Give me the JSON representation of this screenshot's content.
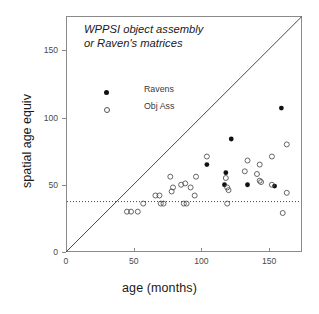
{
  "chart_data": {
    "type": "scatter",
    "title": "",
    "annotation_lines": [
      "WPPSI object assembly",
      "or Raven's matrices"
    ],
    "xlabel": "age (months)",
    "ylabel": "spatial age equiv",
    "xlim": [
      0,
      174
    ],
    "ylim": [
      0,
      175
    ],
    "xticks": [
      0,
      50,
      100,
      150
    ],
    "yticks": [
      0,
      50,
      100,
      150
    ],
    "xtick_labels": [
      "0",
      "50",
      "100",
      "150"
    ],
    "ytick_labels": [
      "0",
      "50",
      "100",
      "150"
    ],
    "grid": false,
    "legend_position": "upper-left-inside",
    "reference_lines": [
      {
        "name": "identity-line",
        "type": "diagonal",
        "from": [
          0,
          0
        ],
        "to": [
          174,
          175
        ],
        "style": "solid"
      },
      {
        "name": "floor-line",
        "type": "horizontal",
        "y": 37.5,
        "style": "dotted"
      }
    ],
    "series": [
      {
        "name": "Ravens",
        "marker": "filled-circle",
        "color": "#111111",
        "points": [
          [
            159,
            107
          ],
          [
            122,
            84
          ],
          [
            104,
            65
          ],
          [
            118,
            59
          ],
          [
            117,
            50
          ],
          [
            134,
            50
          ],
          [
            154,
            49
          ]
        ]
      },
      {
        "name": "Obj Ass",
        "marker": "open-circle",
        "color": "#555555",
        "points": [
          [
            45,
            30
          ],
          [
            48,
            30
          ],
          [
            53,
            30
          ],
          [
            57,
            36
          ],
          [
            70,
            36
          ],
          [
            72,
            36
          ],
          [
            87,
            36
          ],
          [
            89,
            36
          ],
          [
            119,
            36
          ],
          [
            160,
            29
          ],
          [
            66,
            42
          ],
          [
            69,
            42
          ],
          [
            95,
            42
          ],
          [
            79,
            48
          ],
          [
            92,
            48
          ],
          [
            119,
            48
          ],
          [
            120,
            46
          ],
          [
            163,
            44
          ],
          [
            78,
            45
          ],
          [
            85,
            50
          ],
          [
            88,
            51
          ],
          [
            77,
            56
          ],
          [
            96,
            56
          ],
          [
            104,
            71
          ],
          [
            118,
            55
          ],
          [
            132,
            60
          ],
          [
            141,
            58
          ],
          [
            134,
            68
          ],
          [
            143,
            53
          ],
          [
            144,
            52
          ],
          [
            152,
            50
          ],
          [
            143,
            65
          ],
          [
            152,
            71
          ],
          [
            163,
            80
          ]
        ]
      }
    ]
  },
  "axes": {
    "x_title": "age (months)",
    "y_title": "spatial age equiv"
  },
  "legend": {
    "entries": [
      {
        "label": "Ravens",
        "marker": "filled-circle"
      },
      {
        "label": "Obj Ass",
        "marker": "open-circle"
      }
    ]
  },
  "colors": {
    "frame": "#8a8a8a",
    "filled_marker": "#111111",
    "open_marker": "#555555",
    "reference_line": "#4a4a4a",
    "background": "#ffffff"
  }
}
